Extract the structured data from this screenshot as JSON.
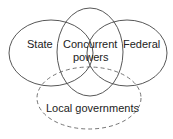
{
  "diagram": {
    "circles": [
      {
        "id": "state",
        "label": "State"
      },
      {
        "id": "concurrent",
        "label_line1": "Concurrent",
        "label_line2": "powers"
      },
      {
        "id": "federal",
        "label": "Federal"
      },
      {
        "id": "local",
        "label": "Local governments",
        "style": "dashed"
      }
    ],
    "stroke_color": "#444444"
  }
}
